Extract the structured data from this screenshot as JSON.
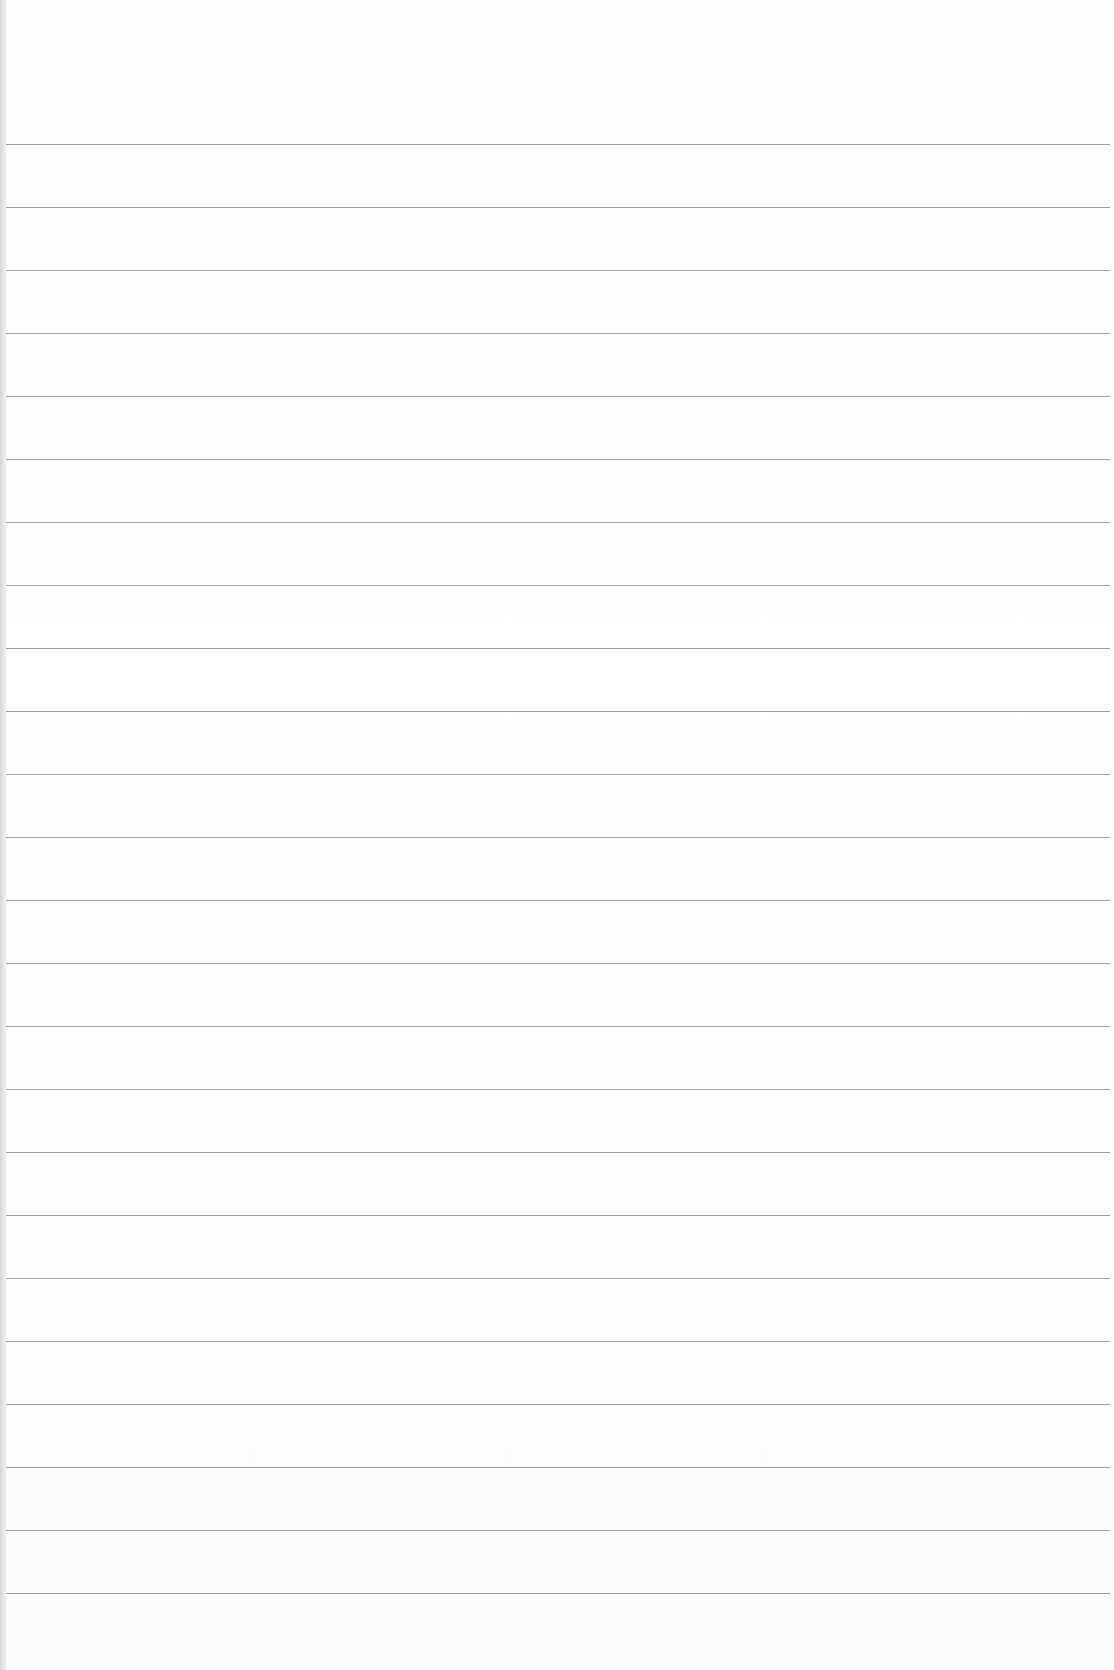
{
  "page": {
    "type": "blank ruled paper",
    "text": "",
    "rule_count": 24,
    "first_rule_y": 144,
    "rule_spacing_px": 63,
    "colors": {
      "paper": "#ffffff",
      "rule": "#8f8f8f",
      "left_edge": "#d9d9d9"
    }
  }
}
